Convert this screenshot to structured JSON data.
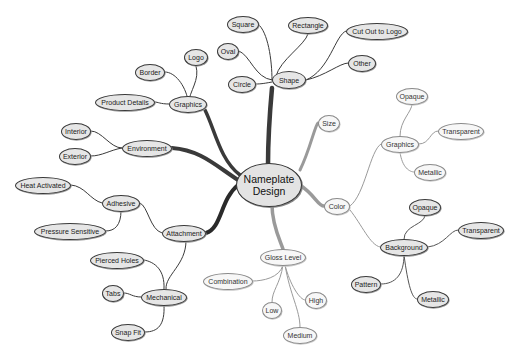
{
  "diagram": {
    "type": "mind-map",
    "root": {
      "id": "root",
      "label": "Nameplate Design"
    },
    "nodes": [
      {
        "id": "shape",
        "label": "Shape",
        "parent": "root",
        "style": "dark",
        "x": 289,
        "y": 80,
        "w": 34,
        "h": 18
      },
      {
        "id": "square",
        "label": "Square",
        "parent": "shape",
        "style": "dark",
        "x": 243,
        "y": 24,
        "w": 32,
        "h": 17
      },
      {
        "id": "rectangle",
        "label": "Rectangle",
        "parent": "shape",
        "style": "dark",
        "x": 308,
        "y": 25,
        "w": 40,
        "h": 17
      },
      {
        "id": "cutout",
        "label": "Cut Out to Logo",
        "parent": "shape",
        "style": "dark",
        "x": 377,
        "y": 31,
        "w": 62,
        "h": 17
      },
      {
        "id": "oval",
        "label": "Oval",
        "parent": "shape",
        "style": "dark",
        "x": 228,
        "y": 51,
        "w": 22,
        "h": 17
      },
      {
        "id": "other",
        "label": "Other",
        "parent": "shape",
        "style": "dark",
        "x": 362,
        "y": 63,
        "w": 28,
        "h": 17
      },
      {
        "id": "circle",
        "label": "Circle",
        "parent": "shape",
        "style": "dark",
        "x": 242,
        "y": 84,
        "w": 28,
        "h": 17
      },
      {
        "id": "graphics-l",
        "label": "Graphics",
        "parent": "root",
        "style": "dark",
        "x": 188,
        "y": 104,
        "w": 38,
        "h": 17
      },
      {
        "id": "logo",
        "label": "Logo",
        "parent": "graphics-l",
        "style": "dark",
        "x": 196,
        "y": 57,
        "w": 24,
        "h": 17
      },
      {
        "id": "border",
        "label": "Border",
        "parent": "graphics-l",
        "style": "dark",
        "x": 150,
        "y": 72,
        "w": 30,
        "h": 17
      },
      {
        "id": "product-details",
        "label": "Product Details",
        "parent": "graphics-l",
        "style": "dark",
        "x": 125,
        "y": 102,
        "w": 60,
        "h": 17
      },
      {
        "id": "environment",
        "label": "Environment",
        "parent": "root",
        "style": "dark",
        "x": 147,
        "y": 148,
        "w": 50,
        "h": 17
      },
      {
        "id": "interior",
        "label": "Interior",
        "parent": "environment",
        "style": "dark",
        "x": 76,
        "y": 131,
        "w": 30,
        "h": 17
      },
      {
        "id": "exterior",
        "label": "Exterior",
        "parent": "environment",
        "style": "dark",
        "x": 75,
        "y": 156,
        "w": 32,
        "h": 17
      },
      {
        "id": "attachment",
        "label": "Attachment",
        "parent": "root",
        "style": "dark",
        "x": 184,
        "y": 233,
        "w": 44,
        "h": 17
      },
      {
        "id": "adhesive",
        "label": "Adhesive",
        "parent": "attachment",
        "style": "dark",
        "x": 121,
        "y": 203,
        "w": 38,
        "h": 17
      },
      {
        "id": "heat-activated",
        "label": "Heat Activated",
        "parent": "adhesive",
        "style": "dark",
        "x": 43,
        "y": 185,
        "w": 56,
        "h": 17
      },
      {
        "id": "pressure-sensitive",
        "label": "Pressure Sensitive",
        "parent": "adhesive",
        "style": "dark",
        "x": 70,
        "y": 231,
        "w": 72,
        "h": 17
      },
      {
        "id": "mechanical",
        "label": "Mechanical",
        "parent": "attachment",
        "style": "dark",
        "x": 164,
        "y": 297,
        "w": 46,
        "h": 17
      },
      {
        "id": "pierced-holes",
        "label": "Pierced Holes",
        "parent": "mechanical",
        "style": "dark",
        "x": 117,
        "y": 260,
        "w": 54,
        "h": 17
      },
      {
        "id": "tabs",
        "label": "Tabs",
        "parent": "mechanical",
        "style": "dark",
        "x": 113,
        "y": 293,
        "w": 22,
        "h": 17
      },
      {
        "id": "snap-fit",
        "label": "Snap Fit",
        "parent": "mechanical",
        "style": "dark",
        "x": 128,
        "y": 332,
        "w": 34,
        "h": 17
      },
      {
        "id": "size",
        "label": "Size",
        "parent": "root",
        "style": "light",
        "x": 329,
        "y": 123,
        "w": 22,
        "h": 17
      },
      {
        "id": "color",
        "label": "Color",
        "parent": "root",
        "style": "light",
        "x": 337,
        "y": 206,
        "w": 26,
        "h": 17
      },
      {
        "id": "graphics-r",
        "label": "Graphics",
        "parent": "color",
        "style": "light",
        "x": 400,
        "y": 144,
        "w": 38,
        "h": 17
      },
      {
        "id": "opaque-1",
        "label": "Opaque",
        "parent": "graphics-r",
        "style": "light",
        "x": 412,
        "y": 96,
        "w": 32,
        "h": 17
      },
      {
        "id": "transparent-1",
        "label": "Transparent",
        "parent": "graphics-r",
        "style": "light",
        "x": 461,
        "y": 131,
        "w": 46,
        "h": 17
      },
      {
        "id": "metallic-1",
        "label": "Metallic",
        "parent": "graphics-r",
        "style": "light",
        "x": 430,
        "y": 172,
        "w": 32,
        "h": 17
      },
      {
        "id": "background",
        "label": "Background",
        "parent": "color",
        "style": "dark",
        "x": 404,
        "y": 247,
        "w": 48,
        "h": 17
      },
      {
        "id": "opaque-2",
        "label": "Opaque",
        "parent": "background",
        "style": "dark",
        "x": 425,
        "y": 207,
        "w": 32,
        "h": 17
      },
      {
        "id": "transparent-2",
        "label": "Transparent",
        "parent": "background",
        "style": "dark",
        "x": 481,
        "y": 230,
        "w": 46,
        "h": 17
      },
      {
        "id": "pattern",
        "label": "Pattern",
        "parent": "background",
        "style": "dark",
        "x": 366,
        "y": 284,
        "w": 30,
        "h": 17
      },
      {
        "id": "metallic-2",
        "label": "Metallic",
        "parent": "background",
        "style": "dark",
        "x": 433,
        "y": 299,
        "w": 32,
        "h": 17
      },
      {
        "id": "gloss-level",
        "label": "Gloss Level",
        "parent": "root",
        "style": "light",
        "x": 283,
        "y": 257,
        "w": 46,
        "h": 17
      },
      {
        "id": "combination",
        "label": "Combination",
        "parent": "gloss-level",
        "style": "light",
        "x": 228,
        "y": 281,
        "w": 50,
        "h": 17
      },
      {
        "id": "low",
        "label": "Low",
        "parent": "gloss-level",
        "style": "light",
        "x": 272,
        "y": 310,
        "w": 20,
        "h": 17
      },
      {
        "id": "high",
        "label": "High",
        "parent": "gloss-level",
        "style": "light",
        "x": 316,
        "y": 300,
        "w": 22,
        "h": 17
      },
      {
        "id": "medium",
        "label": "Medium",
        "parent": "gloss-level",
        "style": "light",
        "x": 300,
        "y": 335,
        "w": 34,
        "h": 17
      }
    ],
    "colors": {
      "dark_stroke": "#3a3a3a",
      "dark_fill": "#e6e6e6",
      "light_stroke": "#8a8a8a",
      "light_fill": "#f7f7f7",
      "root_fill": "#e3e3e3",
      "background": "#ffffff"
    }
  }
}
